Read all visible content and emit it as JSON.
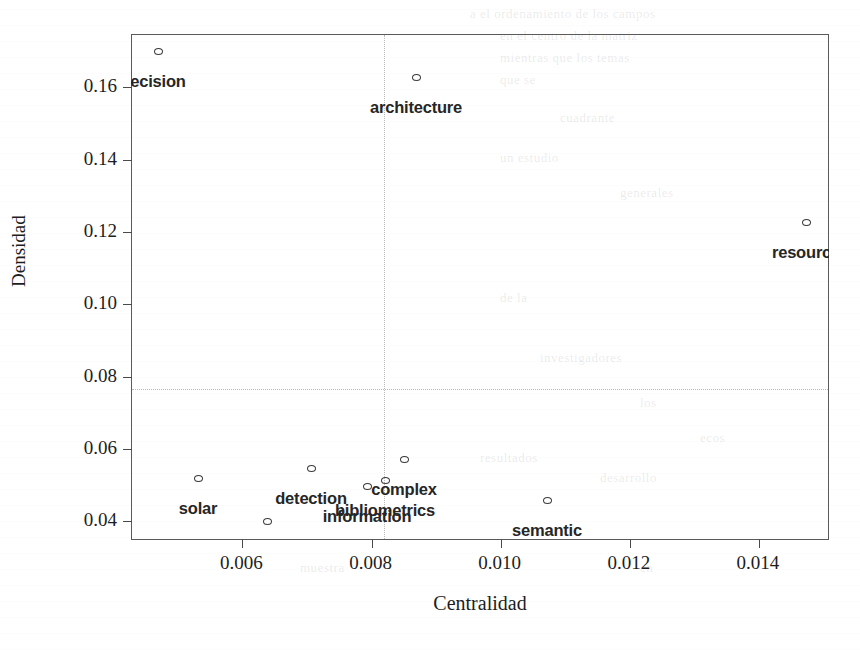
{
  "chart_data": {
    "type": "scatter",
    "title": "",
    "xlabel": "Centralidad",
    "ylabel": "Densidad",
    "xlim": [
      0.00429,
      0.0151
    ],
    "ylim": [
      0.0345,
      0.1745
    ],
    "xticks": [
      0.006,
      0.008,
      0.01,
      0.012,
      0.014
    ],
    "xticklabels": [
      "0.006",
      "0.008",
      "0.010",
      "0.012",
      "0.014"
    ],
    "yticks": [
      0.04,
      0.06,
      0.08,
      0.1,
      0.12,
      0.14,
      0.16
    ],
    "yticklabels": [
      "0.04",
      "0.06",
      "0.08",
      "0.10",
      "0.12",
      "0.14",
      "0.16"
    ],
    "grid": false,
    "reference_lines": {
      "x": 0.0082,
      "y": 0.0765,
      "style": "dotted",
      "color": "#b9b9b9"
    },
    "marker": {
      "shape": "open-circle",
      "edge_color": "#3a3a3a",
      "fill": "none",
      "size_px": 9
    },
    "label_style": {
      "font": "sans-serif-bold",
      "size_px": 16.5,
      "color": "#262626",
      "clipped_at_frame": true
    },
    "points": [
      {
        "label": "ecision",
        "x": 0.00471,
        "y": 0.1722,
        "px": 158,
        "py": 51,
        "label_dx": 0,
        "label_dy": 21
      },
      {
        "label": "architecture",
        "x": 0.0087,
        "y": 0.1647,
        "px": 416,
        "py": 77,
        "label_dx": 0,
        "label_dy": 21
      },
      {
        "label": "resource",
        "x": 0.0149,
        "y": 0.1226,
        "px": 806,
        "py": 222,
        "label_dx": 0,
        "label_dy": 21
      },
      {
        "label": "complex",
        "x": 0.00855,
        "y": 0.0513,
        "px": 404,
        "py": 459,
        "label_dx": 0,
        "label_dy": 21
      },
      {
        "label": "detection",
        "x": 0.007,
        "y": 0.0478,
        "px": 311,
        "py": 468,
        "label_dx": 0,
        "label_dy": 21
      },
      {
        "label": "bibliometrics",
        "x": 0.0082,
        "y": 0.0446,
        "px": 385,
        "py": 480,
        "label_dx": 0,
        "label_dy": 21
      },
      {
        "label": "information",
        "x": 0.0079,
        "y": 0.0433,
        "px": 367,
        "py": 486,
        "label_dx": 0,
        "label_dy": 21
      },
      {
        "label": "solar",
        "x": 0.00534,
        "y": 0.0459,
        "px": 198,
        "py": 478,
        "label_dx": 0,
        "label_dy": 21
      },
      {
        "label": "semantic",
        "x": 0.01087,
        "y": 0.0394,
        "px": 547,
        "py": 500,
        "label_dx": 0,
        "label_dy": 21
      },
      {
        "label": "systematic",
        "x": 0.0064,
        "y": 0.0363,
        "px": 267,
        "py": 521,
        "label_dx": 0,
        "label_dy": 21
      }
    ]
  },
  "background_artifacts": [
    {
      "text": "a el ordenamiento de los campos",
      "x": 470,
      "y": 6
    },
    {
      "text": "en  el  centro  de  la  matriz",
      "x": 500,
      "y": 28
    },
    {
      "text": "mientras  que  los  temas",
      "x": 500,
      "y": 50
    },
    {
      "text": "que se",
      "x": 500,
      "y": 72
    },
    {
      "text": "cuadrante",
      "x": 560,
      "y": 110
    },
    {
      "text": "un  estudio",
      "x": 500,
      "y": 150
    },
    {
      "text": "generales",
      "x": 620,
      "y": 185
    },
    {
      "text": "de la",
      "x": 500,
      "y": 290
    },
    {
      "text": "investigadores",
      "x": 540,
      "y": 350
    },
    {
      "text": "los",
      "x": 640,
      "y": 395
    },
    {
      "text": "ecos",
      "x": 700,
      "y": 430
    },
    {
      "text": "resultados",
      "x": 480,
      "y": 450
    },
    {
      "text": "desarrollo",
      "x": 600,
      "y": 470
    },
    {
      "text": "muestra",
      "x": 300,
      "y": 560
    },
    {
      "text": "en",
      "x": 640,
      "y": 560
    }
  ]
}
